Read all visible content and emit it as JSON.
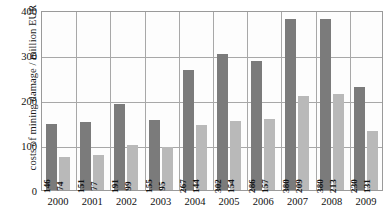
{
  "chart_data": {
    "type": "bar",
    "title": "",
    "subtitle": "",
    "xlabel": "",
    "ylabel": "costs of mining damage / million EUR",
    "categories": [
      "2000",
      "2001",
      "2002",
      "2003",
      "2004",
      "2005",
      "2006",
      "2007",
      "2008",
      "2009"
    ],
    "series": [
      {
        "name": "dark-series",
        "color": "#7b7b7b",
        "values": [
          146,
          151,
          191,
          155,
          267,
          302,
          286,
          380,
          380,
          230
        ]
      },
      {
        "name": "light-series",
        "color": "#b9b9b9",
        "values": [
          74,
          77,
          99,
          95,
          144,
          154,
          157,
          209,
          213,
          131
        ]
      }
    ],
    "ylim": [
      0,
      400
    ],
    "yticks": [
      0,
      100,
      200,
      300,
      400
    ],
    "ytick_labels": [
      "0",
      "100",
      "200",
      "300",
      "400"
    ],
    "grid": true,
    "grid_axis": "both",
    "legend": "none",
    "data_labels": true
  },
  "colors": {
    "dark_bar": "#7b7b7b",
    "light_bar": "#b9b9b9",
    "grid": "#a8a8a8",
    "frame": "#9a9a9a",
    "background": "#ffffff",
    "text": "#101010"
  }
}
